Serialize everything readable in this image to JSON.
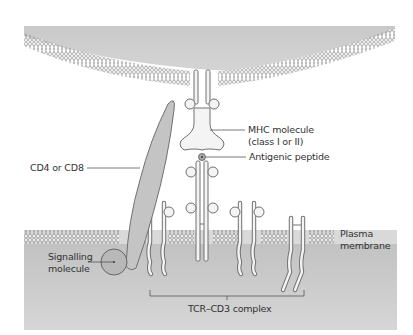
{
  "diagram": {
    "labels": {
      "mhc_line1": "MHC molecule",
      "mhc_line2": "(class I or II)",
      "peptide": "Antigenic peptide",
      "cd4": "CD4 or CD8",
      "plasma_line1": "Plasma",
      "plasma_line2": "membrane",
      "signalling_line1": "Signalling",
      "signalling_line2": "molecule",
      "tcr": "TCR–CD3 complex"
    },
    "colors": {
      "cell_fill": "#c8c8c8",
      "lipid_head": "#e6e6e6",
      "lipid_tail": "#9a9a9a",
      "protein_fill": "#f4f4f4",
      "protein_stroke": "#707070",
      "cd4_fill": "#c4c4c4",
      "signal_fill": "#b8b8b8",
      "text": "#333333"
    }
  }
}
